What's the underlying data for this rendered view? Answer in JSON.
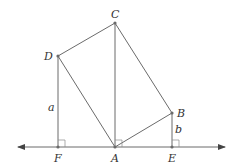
{
  "diagram": {
    "type": "geometry",
    "points": {
      "A": {
        "label": "A",
        "x": 115,
        "y": 147
      },
      "B": {
        "label": "B",
        "x": 172,
        "y": 113
      },
      "C": {
        "label": "C",
        "x": 115,
        "y": 23
      },
      "D": {
        "label": "D",
        "x": 58,
        "y": 56
      },
      "E": {
        "label": "E",
        "x": 172,
        "y": 147
      },
      "F": {
        "label": "F",
        "x": 58,
        "y": 147
      }
    },
    "segments": [
      {
        "from": "A",
        "to": "B"
      },
      {
        "from": "B",
        "to": "C"
      },
      {
        "from": "C",
        "to": "D"
      },
      {
        "from": "D",
        "to": "A"
      },
      {
        "from": "A",
        "to": "C"
      },
      {
        "from": "D",
        "to": "F"
      },
      {
        "from": "B",
        "to": "E"
      }
    ],
    "baseline": {
      "x1": 18,
      "x2": 225,
      "y": 147,
      "arrows": "both"
    },
    "right_angles": [
      "F",
      "A",
      "E"
    ],
    "length_labels": {
      "a": {
        "text": "a",
        "segment": "DF"
      },
      "b": {
        "text": "b",
        "segment": "BE"
      }
    },
    "colors": {
      "line": "#6b6b6b",
      "text": "#333333",
      "background": "#ffffff"
    }
  }
}
